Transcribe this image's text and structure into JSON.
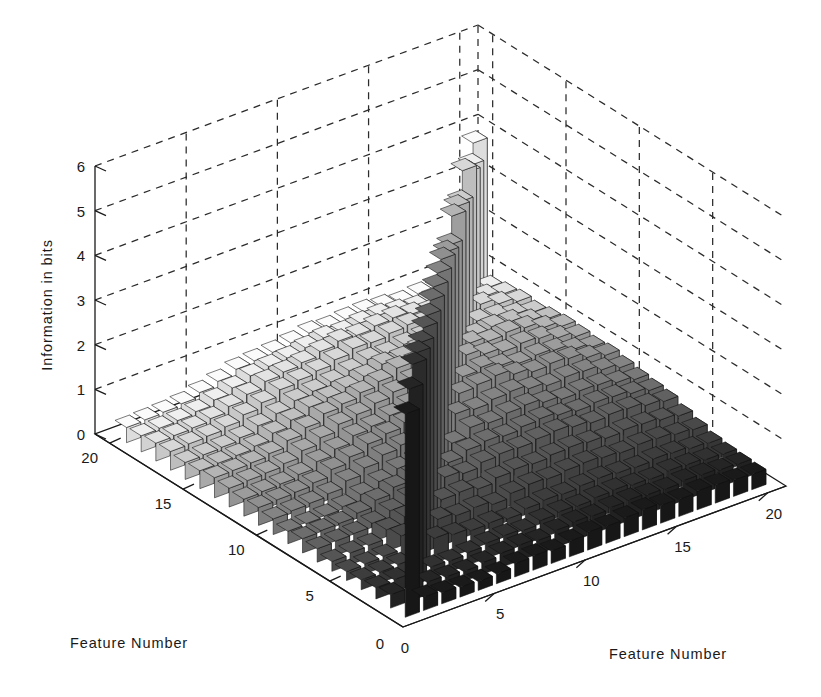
{
  "figure": {
    "background": "#ffffff",
    "width": 821,
    "height": 697,
    "projection": "matlab-3d-bar3"
  },
  "axes": {
    "z": {
      "title": "Information in bits",
      "ticks": [
        "0",
        "1",
        "2",
        "3",
        "4",
        "5",
        "6"
      ],
      "values": [
        0,
        1,
        2,
        3,
        4,
        5,
        6
      ],
      "range": [
        0,
        6
      ]
    },
    "left": {
      "title": "Feature Number",
      "ticks": [
        "0",
        "5",
        "10",
        "15",
        "20"
      ],
      "values": [
        0,
        5,
        10,
        15,
        20
      ],
      "range": [
        0,
        21
      ]
    },
    "right": {
      "title": "Feature Number",
      "ticks": [
        "0",
        "5",
        "10",
        "15",
        "20"
      ],
      "values": [
        0,
        5,
        10,
        15,
        20
      ],
      "range": [
        0,
        21
      ]
    }
  },
  "colors": {
    "axis": "#1a1a1a",
    "grid": "#2b2b2b",
    "text": "#1a1a1a",
    "bar_edge": "#111111",
    "colormap_low": "#1c1c1c",
    "colormap_high": "#fbfbfb"
  },
  "chart_data": {
    "type": "bar",
    "title": "",
    "subtitle": "",
    "xlabel": "Feature Number",
    "ylabel": "Feature Number",
    "zlabel": "Information in bits",
    "xlim": [
      0,
      21
    ],
    "ylim": [
      0,
      21
    ],
    "zlim": [
      0,
      6
    ],
    "grid": true,
    "legend": "none",
    "note": "20x20 symmetric matrix of pairwise information. Large diagonal values are single-feature information; off-diagonal values are joint/mutual information.",
    "x": [
      1,
      2,
      3,
      4,
      5,
      6,
      7,
      8,
      9,
      10,
      11,
      12,
      13,
      14,
      15,
      16,
      17,
      18,
      19,
      20
    ],
    "y": [
      1,
      2,
      3,
      4,
      5,
      6,
      7,
      8,
      9,
      10,
      11,
      12,
      13,
      14,
      15,
      16,
      17,
      18,
      19,
      20
    ],
    "diagonal_values": [
      4.55,
      4.75,
      4.95,
      4.85,
      4.72,
      4.7,
      4.62,
      4.6,
      4.55,
      4.5,
      4.45,
      4.25,
      4.05,
      4.35,
      4.2,
      3.95,
      4.3,
      3.9,
      3.7,
      3.85
    ],
    "z_matrix": [
      [
        4.55,
        0.3,
        0.25,
        0.22,
        0.2,
        0.22,
        0.3,
        0.32,
        0.28,
        0.35,
        0.4,
        0.38,
        0.42,
        0.45,
        0.4,
        0.38,
        0.42,
        0.4,
        0.36,
        0.34
      ],
      [
        0.3,
        4.75,
        0.28,
        0.24,
        0.22,
        0.26,
        0.32,
        0.35,
        0.3,
        0.38,
        0.42,
        0.4,
        0.44,
        0.46,
        0.42,
        0.4,
        0.44,
        0.42,
        0.38,
        0.36
      ],
      [
        0.25,
        0.28,
        4.95,
        0.26,
        0.24,
        0.28,
        0.34,
        0.36,
        0.32,
        0.4,
        0.44,
        0.42,
        0.46,
        0.48,
        0.44,
        0.42,
        0.46,
        0.44,
        0.4,
        0.38
      ],
      [
        0.22,
        0.24,
        0.26,
        4.85,
        0.55,
        0.48,
        0.42,
        0.44,
        0.38,
        0.46,
        0.5,
        0.48,
        0.52,
        0.54,
        0.5,
        0.48,
        0.52,
        0.5,
        0.45,
        0.42
      ],
      [
        0.2,
        0.22,
        0.24,
        0.55,
        4.72,
        0.62,
        0.55,
        0.58,
        0.5,
        0.6,
        0.65,
        0.62,
        0.66,
        0.68,
        0.64,
        0.6,
        0.64,
        0.62,
        0.56,
        0.52
      ],
      [
        0.22,
        0.26,
        0.28,
        0.48,
        0.62,
        4.7,
        0.7,
        0.72,
        0.64,
        0.74,
        0.78,
        0.75,
        0.8,
        0.82,
        0.78,
        0.72,
        0.76,
        0.74,
        0.68,
        0.62
      ],
      [
        0.3,
        0.32,
        0.34,
        0.42,
        0.55,
        0.7,
        4.62,
        0.85,
        0.78,
        0.88,
        0.92,
        0.9,
        0.95,
        0.98,
        0.92,
        0.86,
        0.9,
        0.88,
        0.8,
        0.74
      ],
      [
        0.32,
        0.35,
        0.36,
        0.44,
        0.58,
        0.72,
        0.85,
        4.6,
        0.82,
        0.95,
        1.0,
        0.96,
        1.02,
        1.05,
        0.98,
        0.92,
        0.96,
        0.94,
        0.86,
        0.78
      ],
      [
        0.28,
        0.3,
        0.32,
        0.38,
        0.5,
        0.64,
        0.78,
        0.82,
        4.55,
        0.9,
        1.1,
        1.05,
        1.12,
        1.15,
        1.06,
        0.98,
        1.02,
        1.0,
        0.9,
        0.82
      ],
      [
        0.35,
        0.38,
        0.4,
        0.46,
        0.6,
        0.74,
        0.88,
        0.95,
        0.9,
        4.5,
        1.2,
        1.15,
        1.22,
        1.25,
        1.16,
        1.08,
        1.12,
        1.1,
        0.98,
        0.88
      ],
      [
        0.4,
        0.42,
        0.44,
        0.5,
        0.65,
        0.78,
        0.92,
        1.0,
        1.1,
        1.2,
        4.45,
        1.3,
        1.35,
        1.4,
        1.28,
        1.18,
        1.22,
        1.18,
        1.05,
        0.95
      ],
      [
        0.38,
        0.4,
        0.42,
        0.48,
        0.62,
        0.75,
        0.9,
        0.96,
        1.05,
        1.15,
        1.3,
        4.25,
        1.32,
        1.38,
        1.26,
        1.16,
        1.2,
        1.16,
        1.02,
        0.92
      ],
      [
        0.42,
        0.44,
        0.46,
        0.52,
        0.66,
        0.8,
        0.95,
        1.02,
        1.12,
        1.22,
        1.35,
        1.32,
        4.05,
        1.45,
        1.32,
        1.22,
        1.26,
        1.22,
        1.08,
        0.96
      ],
      [
        0.45,
        0.46,
        0.48,
        0.54,
        0.68,
        0.82,
        0.98,
        1.05,
        1.15,
        1.25,
        1.4,
        1.38,
        1.45,
        4.35,
        1.36,
        1.25,
        1.3,
        1.25,
        1.1,
        0.98
      ],
      [
        0.4,
        0.42,
        0.44,
        0.5,
        0.64,
        0.78,
        0.92,
        0.98,
        1.06,
        1.16,
        1.28,
        1.26,
        1.32,
        1.36,
        4.2,
        1.18,
        1.22,
        1.18,
        1.04,
        0.94
      ],
      [
        0.38,
        0.4,
        0.42,
        0.48,
        0.6,
        0.72,
        0.86,
        0.92,
        0.98,
        1.08,
        1.18,
        1.16,
        1.22,
        1.25,
        1.18,
        3.95,
        1.14,
        1.1,
        0.98,
        0.88
      ],
      [
        0.42,
        0.44,
        0.46,
        0.52,
        0.64,
        0.76,
        0.9,
        0.96,
        1.02,
        1.12,
        1.22,
        1.2,
        1.26,
        1.3,
        1.22,
        1.14,
        4.3,
        1.16,
        1.02,
        0.92
      ],
      [
        0.4,
        0.42,
        0.44,
        0.5,
        0.62,
        0.74,
        0.88,
        0.94,
        1.0,
        1.1,
        1.18,
        1.16,
        1.22,
        1.25,
        1.18,
        1.1,
        1.16,
        3.9,
        0.98,
        0.88
      ],
      [
        0.36,
        0.38,
        0.4,
        0.45,
        0.56,
        0.68,
        0.8,
        0.86,
        0.9,
        0.98,
        1.05,
        1.02,
        1.08,
        1.1,
        1.04,
        0.98,
        1.02,
        0.98,
        3.7,
        0.82
      ],
      [
        0.34,
        0.36,
        0.38,
        0.42,
        0.52,
        0.62,
        0.74,
        0.78,
        0.82,
        0.88,
        0.95,
        0.92,
        0.96,
        0.98,
        0.94,
        0.88,
        0.92,
        0.88,
        0.82,
        3.85
      ]
    ]
  }
}
